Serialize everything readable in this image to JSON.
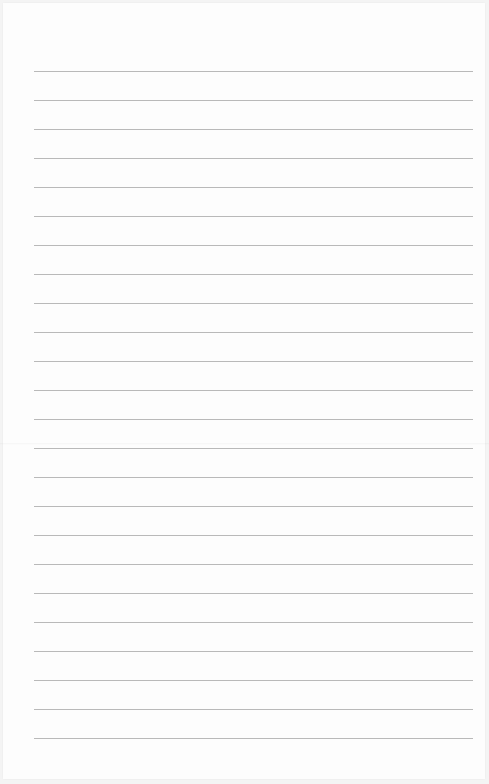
{
  "page": {
    "type": "blank lined paper",
    "background_color": "#fdfdfd",
    "rule_color": "#b9b9b9",
    "rule_count": 24,
    "first_rule_y": 71,
    "rule_spacing": 29,
    "rule_left_x": 34,
    "rule_right_x": 473
  }
}
